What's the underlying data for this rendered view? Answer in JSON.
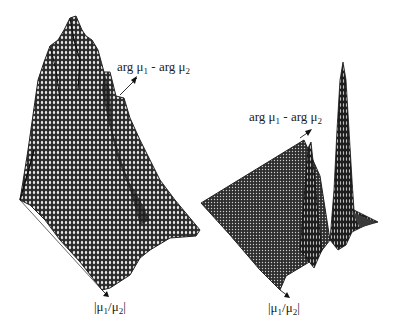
{
  "figure": {
    "panels": [
      {
        "id": "left",
        "description": "3D mesh surface with multiple tall peaks (ridge)",
        "axis_labels": {
          "back_axis": {
            "prefix": "arg μ",
            "sub1": "1",
            "mid": " - arg μ",
            "sub2": "2"
          },
          "front_axis": {
            "open": "|μ",
            "sub1": "1",
            "mid": "/μ",
            "sub2": "2",
            "close": "|"
          }
        }
      },
      {
        "id": "right",
        "description": "3D mesh surface, flat plane with two sharp peaks",
        "axis_labels": {
          "back_axis": {
            "prefix": "arg μ",
            "sub1": "1",
            "mid": " - arg μ",
            "sub2": "2"
          },
          "front_axis": {
            "open": "|μ",
            "sub1": "1",
            "mid": "/μ",
            "sub2": "2",
            "close": "|"
          }
        }
      }
    ],
    "colors": {
      "mesh_dark": "#2a2a2a",
      "mesh_light": "#e8e8e8",
      "axis": "#555555"
    }
  }
}
